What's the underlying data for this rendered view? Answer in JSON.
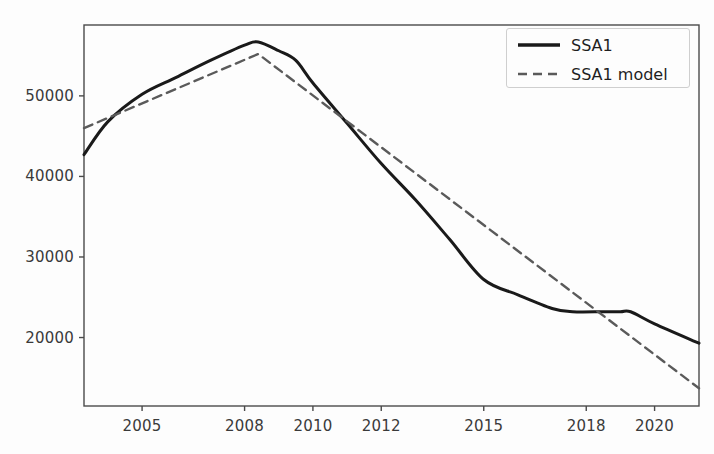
{
  "chart_data": {
    "type": "line",
    "title": "",
    "xlabel": "",
    "ylabel": "",
    "xlim": [
      2003.3,
      2021.3
    ],
    "ylim": [
      11500,
      58800
    ],
    "grid": false,
    "legend_position": "upper right",
    "xticks": [
      2005,
      2008,
      2010,
      2012,
      2015,
      2018,
      2020
    ],
    "xticklabels": [
      "2005",
      "2008",
      "2010",
      "2012",
      "2015",
      "2018",
      "2020"
    ],
    "yticks": [
      20000,
      30000,
      40000,
      50000
    ],
    "yticklabels": [
      "20000",
      "30000",
      "40000",
      "50000"
    ],
    "series": [
      {
        "name": "SSA1",
        "style": "solid",
        "color": "#1a1a1a",
        "linewidth": 3.0,
        "x": [
          2003.3,
          2004,
          2005,
          2006,
          2007,
          2008,
          2008.4,
          2009,
          2009.5,
          2010,
          2011,
          2012,
          2013,
          2014,
          2015,
          2016,
          2017,
          2017.6,
          2018.5,
          2019,
          2019.3,
          2020,
          2021.3
        ],
        "y": [
          42700,
          46800,
          50200,
          52300,
          54400,
          56300,
          56700,
          55600,
          54400,
          51600,
          46600,
          41600,
          37100,
          32200,
          27200,
          25300,
          23600,
          23200,
          23200,
          23200,
          23200,
          21700,
          19300
        ]
      },
      {
        "name": "SSA1 model",
        "style": "dashed",
        "color": "#5a5a5a",
        "linewidth": 2.4,
        "x": [
          2003.3,
          2008.4,
          2021.3
        ],
        "y": [
          46000,
          55200,
          13700
        ]
      }
    ],
    "annotations": [],
    "crossings": [
      {
        "x": 2011.3,
        "y": 45200,
        "note": "series cross near 2011.3"
      },
      {
        "x": 2018.6,
        "y": 23200,
        "note": "series cross near 2018.6"
      }
    ]
  },
  "legend": {
    "entries": [
      {
        "label": "SSA1",
        "style": "solid"
      },
      {
        "label": "SSA1 model",
        "style": "dashed"
      }
    ]
  },
  "axes": {
    "frame_color": "#4a4a4a",
    "tick_color": "#4a4a4a",
    "label_color": "#3a3a3a",
    "background": "#fdfdfd"
  }
}
